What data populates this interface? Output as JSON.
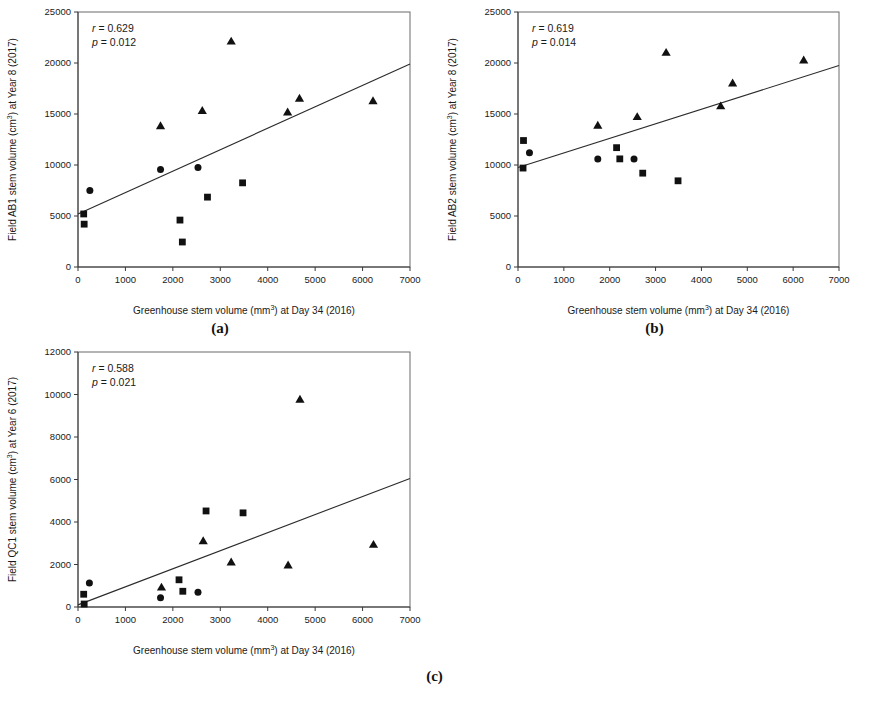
{
  "figure": {
    "panels": [
      {
        "key": "a",
        "label": "(a)"
      },
      {
        "key": "b",
        "label": "(b)"
      },
      {
        "key": "c",
        "label": "(c)"
      }
    ]
  },
  "chart_data": [
    {
      "panel": "a",
      "type": "scatter",
      "title": "",
      "xlabel": "Greenhouse stem volume (mm3) at Day 34 (2016)",
      "xlabel_parts": {
        "pre": "Greenhouse stem volume (mm",
        "sup": "3",
        "post": ") at Day 34 (2016)"
      },
      "ylabel": "Field AB1 stem volume (cm3) at Year 8 (2017)",
      "ylabel_parts": {
        "pre": "Field AB1 stem volume (cm",
        "sup": "3",
        "post": ") at Year 8 (2017)"
      },
      "xlim": [
        0,
        7000
      ],
      "ylim": [
        0,
        25000
      ],
      "xticks": [
        0,
        1000,
        2000,
        3000,
        4000,
        5000,
        6000,
        7000
      ],
      "yticks": [
        0,
        5000,
        10000,
        15000,
        20000,
        25000
      ],
      "grid": false,
      "legend": "none",
      "annotations": {
        "r_label": "r = 0.629",
        "p_label": "p = 0.012",
        "r": 0.629,
        "p": 0.012
      },
      "fit_line": {
        "x0": 0,
        "y0": 5200,
        "x1": 7000,
        "y1": 19900
      },
      "series": [
        {
          "name": "circle",
          "marker": "circle",
          "points": [
            [
              250,
              7500
            ],
            [
              1740,
              9560
            ],
            [
              2530,
              9750
            ]
          ]
        },
        {
          "name": "square",
          "marker": "square",
          "points": [
            [
              120,
              5200
            ],
            [
              130,
              4200
            ],
            [
              2150,
              4600
            ],
            [
              2200,
              2450
            ],
            [
              2730,
              6850
            ],
            [
              3470,
              8250
            ]
          ]
        },
        {
          "name": "triangle",
          "marker": "triangle",
          "points": [
            [
              1740,
              13850
            ],
            [
              2620,
              15350
            ],
            [
              3230,
              22150
            ],
            [
              4420,
              15200
            ],
            [
              4670,
              16550
            ],
            [
              6220,
              16300
            ]
          ]
        }
      ]
    },
    {
      "panel": "b",
      "type": "scatter",
      "title": "",
      "xlabel": "Greenhouse stem volume (mm3) at Day 34 (2016)",
      "xlabel_parts": {
        "pre": "Greenhouse stem volume (mm",
        "sup": "3",
        "post": ") at Day 34 (2016)"
      },
      "ylabel": "Field AB2 stem volume (cm3) at Year 8 (2017)",
      "ylabel_parts": {
        "pre": "Field AB2 stem volume (cm",
        "sup": "3",
        "post": ") at Year 8 (2017)"
      },
      "xlim": [
        0,
        7000
      ],
      "ylim": [
        0,
        25000
      ],
      "xticks": [
        0,
        1000,
        2000,
        3000,
        4000,
        5000,
        6000,
        7000
      ],
      "yticks": [
        0,
        5000,
        10000,
        15000,
        20000,
        25000
      ],
      "grid": false,
      "legend": "none",
      "annotations": {
        "r_label": "r = 0.619",
        "p_label": "p = 0.014",
        "r": 0.619,
        "p": 0.014
      },
      "fit_line": {
        "x0": 0,
        "y0": 9750,
        "x1": 7000,
        "y1": 19750
      },
      "series": [
        {
          "name": "circle",
          "marker": "circle",
          "points": [
            [
              250,
              11200
            ],
            [
              1740,
              10600
            ],
            [
              2530,
              10600
            ]
          ]
        },
        {
          "name": "square",
          "marker": "square",
          "points": [
            [
              120,
              12400
            ],
            [
              110,
              9700
            ],
            [
              2150,
              11700
            ],
            [
              2220,
              10600
            ],
            [
              2720,
              9200
            ],
            [
              3490,
              8450
            ]
          ]
        },
        {
          "name": "triangle",
          "marker": "triangle",
          "points": [
            [
              1740,
              13900
            ],
            [
              2600,
              14750
            ],
            [
              3230,
              21050
            ],
            [
              4420,
              15800
            ],
            [
              4680,
              18050
            ],
            [
              6230,
              20300
            ]
          ]
        }
      ]
    },
    {
      "panel": "c",
      "type": "scatter",
      "title": "",
      "xlabel": "Greenhouse stem volume (mm3) at Day 34 (2016)",
      "xlabel_parts": {
        "pre": "Greenhouse stem volume (mm",
        "sup": "3",
        "post": ") at Day 34 (2016)"
      },
      "ylabel": "Field QC1 stem volume (cm3) at Year 6 (2017)",
      "ylabel_parts": {
        "pre": "Field QC1 stem volume (cm",
        "sup": "3",
        "post": ") at Year 6 (2017)"
      },
      "xlim": [
        0,
        7000
      ],
      "ylim": [
        0,
        12000
      ],
      "xticks": [
        0,
        1000,
        2000,
        3000,
        4000,
        5000,
        6000,
        7000
      ],
      "yticks": [
        0,
        2000,
        4000,
        6000,
        8000,
        10000,
        12000
      ],
      "grid": false,
      "legend": "none",
      "annotations": {
        "r_label": "r = 0.588",
        "p_label": "p = 0.021",
        "r": 0.588,
        "p": 0.021
      },
      "fit_line": {
        "x0": 0,
        "y0": 100,
        "x1": 7000,
        "y1": 6050
      },
      "series": [
        {
          "name": "circle",
          "marker": "circle",
          "points": [
            [
              240,
              1130
            ],
            [
              1740,
              430
            ],
            [
              2530,
              690
            ]
          ]
        },
        {
          "name": "square",
          "marker": "square",
          "points": [
            [
              120,
              600
            ],
            [
              130,
              140
            ],
            [
              2130,
              1280
            ],
            [
              2210,
              740
            ],
            [
              2700,
              4520
            ],
            [
              3480,
              4430
            ]
          ]
        },
        {
          "name": "triangle",
          "marker": "triangle",
          "points": [
            [
              1760,
              940
            ],
            [
              2640,
              3120
            ],
            [
              3230,
              2120
            ],
            [
              4430,
              1980
            ],
            [
              4680,
              9780
            ],
            [
              6230,
              2950
            ]
          ]
        }
      ]
    }
  ]
}
